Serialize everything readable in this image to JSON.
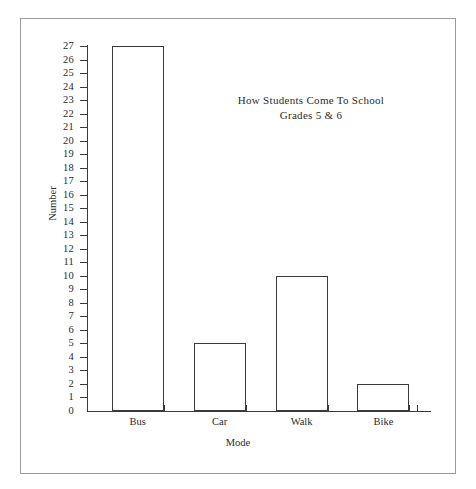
{
  "chart_data": {
    "type": "bar",
    "title": "How Students Come To School",
    "subtitle": "Grades 5 & 6",
    "categories": [
      "Bus",
      "Car",
      "Walk",
      "Bike"
    ],
    "values": [
      27,
      5,
      10,
      2
    ],
    "xlabel": "Mode",
    "ylabel": "Number",
    "ylim": [
      0,
      27
    ],
    "ytick_step": 1,
    "yticks": [
      0,
      1,
      2,
      3,
      4,
      5,
      6,
      7,
      8,
      9,
      10,
      11,
      12,
      13,
      14,
      15,
      16,
      17,
      18,
      19,
      20,
      21,
      22,
      23,
      24,
      25,
      26,
      27
    ],
    "ytick_labels": [
      "0",
      "1",
      "2",
      "3",
      "4",
      "5",
      "6",
      "7",
      "8",
      "9",
      "10",
      "11",
      "12",
      "13",
      "14",
      "15",
      "16",
      "17",
      "18",
      "19",
      "20",
      "21",
      "22",
      "23",
      "24",
      "25",
      "26",
      "27"
    ],
    "grid": false,
    "legend": null,
    "bar_fill_color": "#ffffff",
    "bar_edge_color": "#3a3a3a",
    "axis_color": "#3a3a3a",
    "frame_color": "#9a9a9a",
    "background_color": "#ffffff"
  },
  "figure": {
    "has_outer_frame": true
  }
}
